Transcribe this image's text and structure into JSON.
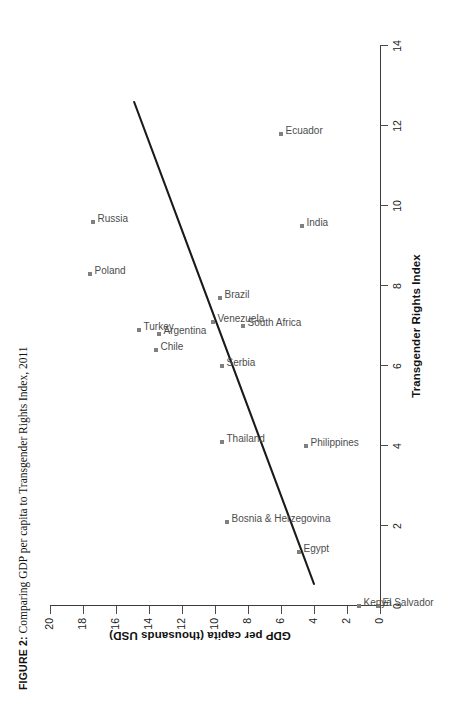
{
  "caption": {
    "figure_label": "FIGURE 2:",
    "text": " Comparing GDP per capita to Transgender Rights Index, 2011"
  },
  "chart_data": {
    "type": "scatter",
    "title": "FIGURE 2: Comparing GDP per capita to Transgender Rights Index, 2011",
    "xlabel": "Transgender Rights Index",
    "ylabel": "GDP per capita (thousands USD)",
    "xlim": [
      0,
      14
    ],
    "ylim": [
      0,
      20
    ],
    "xticks": [
      0,
      2,
      4,
      6,
      8,
      10,
      12,
      14
    ],
    "yticks": [
      0,
      2,
      4,
      6,
      8,
      10,
      12,
      14,
      16,
      18,
      20
    ],
    "grid": false,
    "legend": "none",
    "marker_color": "#808080",
    "label_color": "#4d4d4d",
    "trendline": {
      "visible": true,
      "color": "#1a1a1a",
      "x_start": 0.55,
      "y_start": 4.0,
      "x_end": 12.6,
      "y_end": 14.9,
      "note": "straight fitted line drawn across plot"
    },
    "points": [
      {
        "label": "El Salvador",
        "x": 0.0,
        "y": 0.15
      },
      {
        "label": "Kenya",
        "x": 0.0,
        "y": 1.3
      },
      {
        "label": "Egypt",
        "x": 1.35,
        "y": 4.9
      },
      {
        "label": "Philippines",
        "x": 4.0,
        "y": 4.5
      },
      {
        "label": "Bosnia & Herzegovina",
        "x": 2.1,
        "y": 9.3
      },
      {
        "label": "Thailand",
        "x": 4.1,
        "y": 9.6
      },
      {
        "label": "Serbia",
        "x": 6.0,
        "y": 9.6
      },
      {
        "label": "South Africa",
        "x": 7.0,
        "y": 8.3
      },
      {
        "label": "Venezuela",
        "x": 7.1,
        "y": 10.1
      },
      {
        "label": "Brazil",
        "x": 7.7,
        "y": 9.7
      },
      {
        "label": "India",
        "x": 9.5,
        "y": 4.7
      },
      {
        "label": "Ecuador",
        "x": 11.8,
        "y": 6.0
      },
      {
        "label": "Chile",
        "x": 6.4,
        "y": 13.6
      },
      {
        "label": "Argentina",
        "x": 6.8,
        "y": 13.4
      },
      {
        "label": "Turkey",
        "x": 6.9,
        "y": 14.6
      },
      {
        "label": "Poland",
        "x": 8.3,
        "y": 17.6
      },
      {
        "label": "Russia",
        "x": 9.6,
        "y": 17.4
      }
    ]
  }
}
